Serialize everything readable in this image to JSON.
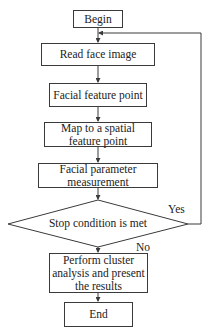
{
  "flowchart": {
    "nodes": [
      {
        "id": "begin",
        "type": "terminal",
        "label": "Begin"
      },
      {
        "id": "read",
        "type": "process",
        "label": "Read face image"
      },
      {
        "id": "feature",
        "type": "process",
        "label": "Facial feature point"
      },
      {
        "id": "map",
        "type": "process",
        "label_line1": "Map to a spatial",
        "label_line2": "feature point"
      },
      {
        "id": "measure",
        "type": "process",
        "label_line1": "Facial parameter",
        "label_line2": "measurement"
      },
      {
        "id": "stop",
        "type": "decision",
        "label": "Stop condition is met"
      },
      {
        "id": "cluster",
        "type": "process",
        "label_line1": "Perform cluster",
        "label_line2": "analysis and present",
        "label_line3": "the results"
      },
      {
        "id": "end",
        "type": "terminal",
        "label": "End"
      }
    ],
    "edges": [
      {
        "from": "begin",
        "to": "read"
      },
      {
        "from": "read",
        "to": "feature"
      },
      {
        "from": "feature",
        "to": "map"
      },
      {
        "from": "map",
        "to": "measure"
      },
      {
        "from": "measure",
        "to": "stop"
      },
      {
        "from": "stop",
        "to": "read",
        "label": "Yes"
      },
      {
        "from": "stop",
        "to": "cluster",
        "label": "No"
      },
      {
        "from": "cluster",
        "to": "end"
      }
    ],
    "edge_labels": {
      "yes": "Yes",
      "no": "No"
    },
    "colors": {
      "line": "#3a3a3a",
      "text": "#222222",
      "background": "#ffffff"
    }
  }
}
